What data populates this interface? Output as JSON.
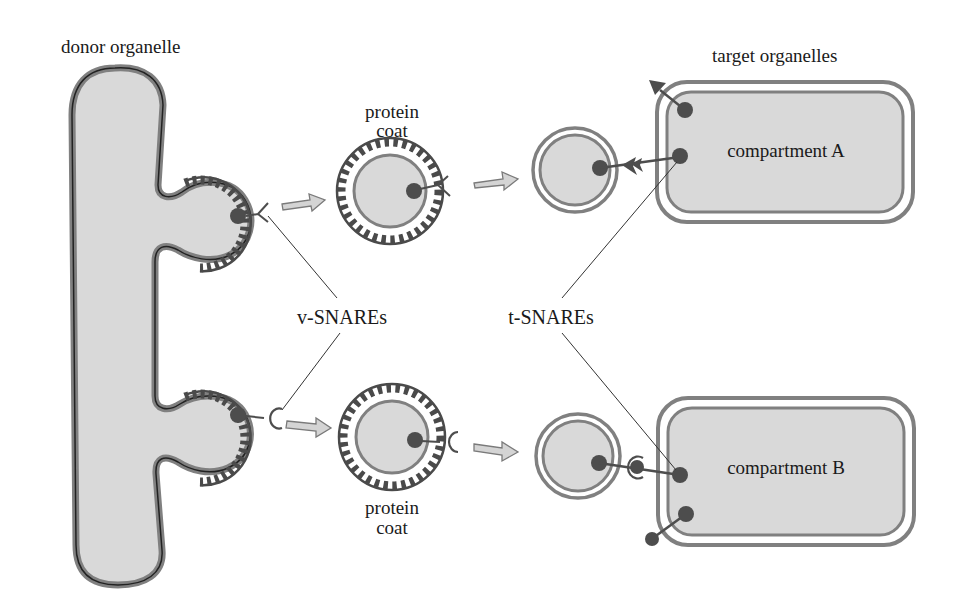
{
  "labels": {
    "donor": "donor organelle",
    "target": "target organelles",
    "protein_coat_top_1": "protein",
    "protein_coat_top_2": "coat",
    "protein_coat_bottom_1": "protein",
    "protein_coat_bottom_2": "coat",
    "v_snares": "v-SNAREs",
    "t_snares": "t-SNAREs",
    "compartment_a": "compartment A",
    "compartment_b": "compartment B"
  },
  "colors": {
    "lumen": "#d9d9d9",
    "membrane": "#7f7f7f",
    "membrane_dark": "#222222",
    "coat": "#4a4a4a",
    "snare": "#4d4d4d",
    "arrow_fill": "#d4d4d4",
    "arrow_stroke": "#7a7a7a",
    "leader_line": "#333333",
    "text": "#1a1a1a"
  }
}
